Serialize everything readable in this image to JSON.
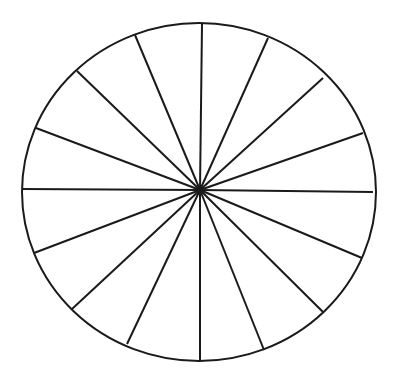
{
  "figure": {
    "sector_count": 16,
    "stroke_color": "#1a1a1a",
    "background_color": "#ffffff",
    "circle": {
      "cx": 199,
      "cy": 192,
      "rx": 177,
      "ry": 169
    },
    "center": {
      "x": 200,
      "y": 190
    },
    "spokes": [
      {
        "x": 202,
        "y": 24
      },
      {
        "x": 268,
        "y": 38
      },
      {
        "x": 323,
        "y": 78
      },
      {
        "x": 363,
        "y": 133
      },
      {
        "x": 373,
        "y": 192
      },
      {
        "x": 362,
        "y": 258
      },
      {
        "x": 323,
        "y": 312
      },
      {
        "x": 264,
        "y": 350
      },
      {
        "x": 200,
        "y": 361
      },
      {
        "x": 127,
        "y": 344
      },
      {
        "x": 72,
        "y": 309
      },
      {
        "x": 34,
        "y": 253
      },
      {
        "x": 22,
        "y": 189
      },
      {
        "x": 36,
        "y": 128
      },
      {
        "x": 77,
        "y": 71
      },
      {
        "x": 135,
        "y": 35
      }
    ]
  }
}
